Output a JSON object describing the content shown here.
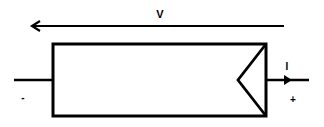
{
  "diagram": {
    "component": "two-terminal element (source symbol)",
    "labels": {
      "voltage": "V",
      "current": "I",
      "negative_terminal": "-",
      "positive_terminal": "+"
    },
    "colors": {
      "stroke": "#000000",
      "background": "#ffffff"
    }
  }
}
